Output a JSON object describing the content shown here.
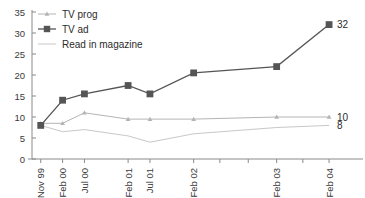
{
  "chart_data": {
    "type": "line",
    "title": "",
    "xlabel": "",
    "ylabel": "",
    "ylim": [
      0,
      35
    ],
    "yticks": [
      0,
      5,
      10,
      15,
      20,
      25,
      30,
      35
    ],
    "grid": false,
    "legend_position": "top-left",
    "categories": [
      "Nov 99",
      "Feb 00",
      "Jul 00",
      "Feb 01",
      "Jul 01",
      "Feb 02",
      "Feb 03",
      "Feb 04"
    ],
    "x_positions": [
      0,
      1,
      2,
      4,
      5,
      7,
      10.8,
      13.2
    ],
    "x_axis_min": -0.4,
    "x_axis_max": 13.7,
    "series": [
      {
        "name": "TV prog",
        "marker": "triangle",
        "color": "#b4b4b4",
        "end_label": "10",
        "values": [
          8.5,
          8.5,
          11,
          9.5,
          9.5,
          9.5,
          10,
          10
        ]
      },
      {
        "name": "TV ad",
        "marker": "square",
        "color": "#555555",
        "end_label": "32",
        "values": [
          8,
          14,
          15.5,
          17.5,
          15.5,
          20.5,
          22,
          32
        ]
      },
      {
        "name": "Read  in magazine",
        "marker": "none",
        "color": "#c8c8c8",
        "end_label": "8",
        "values": [
          8,
          6.5,
          7,
          5.5,
          4,
          6,
          7.5,
          8
        ]
      }
    ]
  },
  "legend": {
    "items": [
      {
        "label": "TV prog"
      },
      {
        "label": "TV ad"
      },
      {
        "label": "Read  in magazine"
      }
    ]
  },
  "axis": {
    "y_tick_labels": [
      "35",
      "30",
      "25",
      "20",
      "15",
      "10",
      "5",
      "0"
    ],
    "x_tick_labels": [
      "Nov 99",
      "Feb 00",
      "Jul 00",
      "Feb 01",
      "Jul 01",
      "Feb 02",
      "Feb 03",
      "Feb 04"
    ]
  },
  "end_labels": {
    "tv_ad": "32",
    "tv_prog": "10",
    "magazine": "8"
  }
}
